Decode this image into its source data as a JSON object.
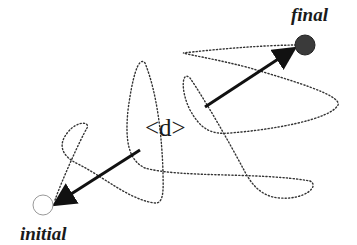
{
  "diagram": {
    "labels": {
      "final": "final",
      "initial": "initial",
      "displacement": "<d>"
    },
    "colors": {
      "final_point": "#3a3a3a",
      "initial_point": "#ffffff",
      "path": "#333333",
      "arrow": "#111111"
    },
    "points": [
      {
        "name": "initial",
        "fill": "hollow"
      },
      {
        "name": "final",
        "fill": "filled"
      }
    ]
  }
}
